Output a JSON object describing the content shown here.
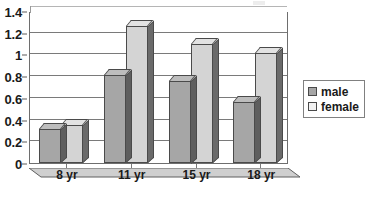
{
  "chart_data": {
    "type": "bar",
    "title": "",
    "subtitle": "",
    "xlabel": "",
    "ylabel": "",
    "categories": [
      "8 yr",
      "11 yr",
      "15 yr",
      "18 yr"
    ],
    "series": [
      {
        "name": "male",
        "values": [
          0.31,
          0.81,
          0.76,
          0.56
        ],
        "color": "#a6a6a6"
      },
      {
        "name": "female",
        "values": [
          0.35,
          1.26,
          1.1,
          1.01
        ],
        "color": "#d4d4d4"
      }
    ],
    "ylim": [
      0,
      1.4
    ],
    "y_ticks": [
      "0",
      "0.2",
      "0.4",
      "0.6",
      "0.8",
      "1",
      "1.2",
      "1.4"
    ],
    "y_tick_values": [
      0,
      0.2,
      0.4,
      0.6,
      0.8,
      1,
      1.2,
      1.4
    ],
    "grid": true,
    "grid_axis": "y",
    "legend_position": "right",
    "style": "3d-clustered-column"
  },
  "legend": {
    "entries": [
      {
        "label": "male",
        "swatch": "male"
      },
      {
        "label": "female",
        "swatch": "female"
      }
    ]
  },
  "axes": {
    "y_labels": [
      "1.4",
      "1.2",
      "1",
      "0.8",
      "0.6",
      "0.4",
      "0.2",
      "0"
    ],
    "x_labels": [
      "8 yr",
      "11 yr",
      "15 yr",
      "18 yr"
    ]
  },
  "colors": {
    "male_bar": "#a6a6a6",
    "female_bar": "#d4d4d4",
    "bar_outline": "#4a4a4a",
    "gridline": "#7a7a7a",
    "text": "#1a1a1a",
    "background": "#ffffff"
  }
}
